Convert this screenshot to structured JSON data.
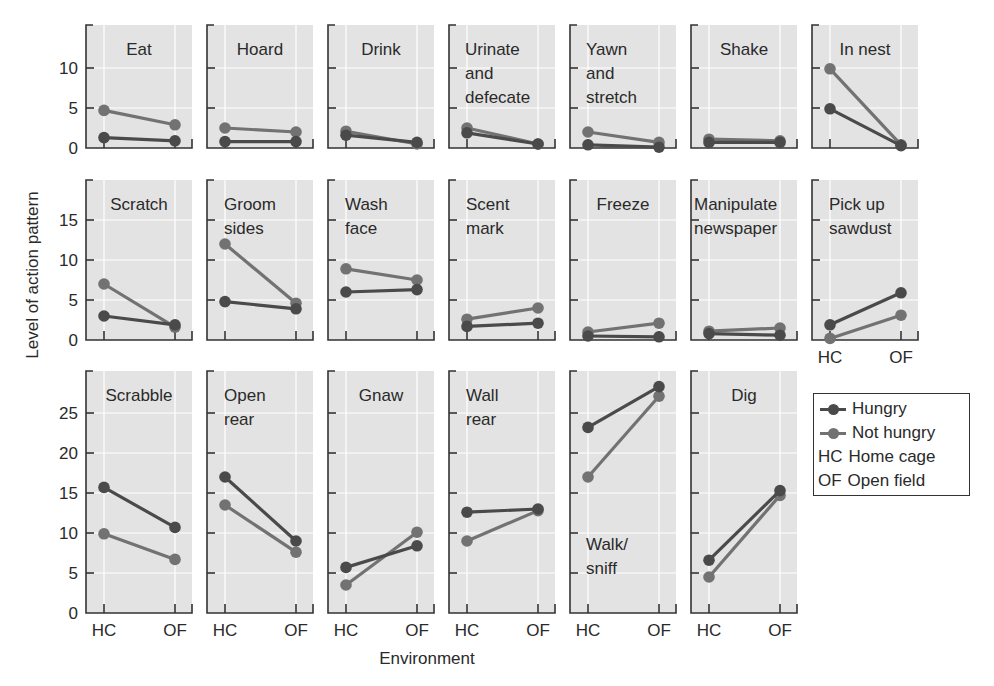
{
  "chart_data": {
    "type": "line",
    "title": "",
    "xlabel": "Environment",
    "ylabel": "Level of action pattern",
    "categories": [
      "HC",
      "OF"
    ],
    "legend": [
      {
        "key": "line",
        "label": "Hungry",
        "color": "#4a4a4a"
      },
      {
        "key": "line",
        "label": "Not hungry",
        "color": "#6f6f6f"
      },
      {
        "key": "HC",
        "label": "Home cage"
      },
      {
        "key": "OF",
        "label": "Open field"
      }
    ],
    "legend_position": "right, lower row",
    "grid": true,
    "rows": [
      {
        "ylim": [
          0,
          15
        ],
        "yticks": [
          0,
          5,
          10
        ],
        "panels": [
          {
            "title": "Eat",
            "series": [
              {
                "name": "Hungry",
                "values": [
                  1.3,
                  0.9
                ]
              },
              {
                "name": "Not hungry",
                "values": [
                  4.7,
                  2.9
                ]
              }
            ]
          },
          {
            "title": "Hoard",
            "series": [
              {
                "name": "Hungry",
                "values": [
                  0.8,
                  0.8
                ]
              },
              {
                "name": "Not hungry",
                "values": [
                  2.5,
                  2.0
                ]
              }
            ]
          },
          {
            "title": "Drink",
            "series": [
              {
                "name": "Hungry",
                "values": [
                  1.6,
                  0.7
                ]
              },
              {
                "name": "Not hungry",
                "values": [
                  2.1,
                  0.5
                ]
              }
            ]
          },
          {
            "title": "Urinate and defecate",
            "series": [
              {
                "name": "Hungry",
                "values": [
                  1.9,
                  0.5
                ]
              },
              {
                "name": "Not hungry",
                "values": [
                  2.5,
                  0.5
                ]
              }
            ]
          },
          {
            "title": "Yawn and stretch",
            "series": [
              {
                "name": "Hungry",
                "values": [
                  0.4,
                  0.1
                ]
              },
              {
                "name": "Not hungry",
                "values": [
                  2.0,
                  0.7
                ]
              }
            ]
          },
          {
            "title": "Shake",
            "series": [
              {
                "name": "Hungry",
                "values": [
                  0.7,
                  0.7
                ]
              },
              {
                "name": "Not hungry",
                "values": [
                  1.1,
                  0.9
                ]
              }
            ]
          },
          {
            "title": "In nest",
            "series": [
              {
                "name": "Hungry",
                "values": [
                  4.9,
                  0.3
                ]
              },
              {
                "name": "Not hungry",
                "values": [
                  9.9,
                  0.4
                ]
              }
            ]
          }
        ]
      },
      {
        "ylim": [
          0,
          19
        ],
        "yticks": [
          0,
          5,
          10,
          15
        ],
        "panels": [
          {
            "title": "Scratch",
            "series": [
              {
                "name": "Hungry",
                "values": [
                  3.0,
                  1.9
                ]
              },
              {
                "name": "Not hungry",
                "values": [
                  7.0,
                  1.6
                ]
              }
            ]
          },
          {
            "title": "Groom sides",
            "series": [
              {
                "name": "Hungry",
                "values": [
                  4.8,
                  3.9
                ]
              },
              {
                "name": "Not hungry",
                "values": [
                  12.0,
                  4.6
                ]
              }
            ]
          },
          {
            "title": "Wash face",
            "series": [
              {
                "name": "Hungry",
                "values": [
                  6.0,
                  6.3
                ]
              },
              {
                "name": "Not hungry",
                "values": [
                  8.9,
                  7.5
                ]
              }
            ]
          },
          {
            "title": "Scent mark",
            "series": [
              {
                "name": "Hungry",
                "values": [
                  1.7,
                  2.1
                ]
              },
              {
                "name": "Not hungry",
                "values": [
                  2.6,
                  4.0
                ]
              }
            ]
          },
          {
            "title": "Freeze",
            "series": [
              {
                "name": "Hungry",
                "values": [
                  0.5,
                  0.4
                ]
              },
              {
                "name": "Not hungry",
                "values": [
                  1.0,
                  2.1
                ]
              }
            ]
          },
          {
            "title": "Manipulate newspaper",
            "series": [
              {
                "name": "Hungry",
                "values": [
                  0.8,
                  0.6
                ]
              },
              {
                "name": "Not hungry",
                "values": [
                  1.1,
                  1.5
                ]
              }
            ]
          },
          {
            "title": "Pick up sawdust",
            "series": [
              {
                "name": "Hungry",
                "values": [
                  1.9,
                  5.9
                ]
              },
              {
                "name": "Not hungry",
                "values": [
                  0.2,
                  3.1
                ]
              }
            ],
            "show_x_ticks": true
          }
        ]
      },
      {
        "ylim": [
          0,
          29
        ],
        "yticks": [
          0,
          5,
          10,
          15,
          20,
          25
        ],
        "panels": [
          {
            "title": "Scrabble",
            "series": [
              {
                "name": "Hungry",
                "values": [
                  15.7,
                  10.7
                ]
              },
              {
                "name": "Not hungry",
                "values": [
                  9.9,
                  6.7
                ]
              }
            ]
          },
          {
            "title": "Open rear",
            "series": [
              {
                "name": "Hungry",
                "values": [
                  17.0,
                  9.0
                ]
              },
              {
                "name": "Not hungry",
                "values": [
                  13.5,
                  7.6
                ]
              }
            ]
          },
          {
            "title": "Gnaw",
            "series": [
              {
                "name": "Hungry",
                "values": [
                  5.7,
                  8.4
                ]
              },
              {
                "name": "Not hungry",
                "values": [
                  3.5,
                  10.1
                ]
              }
            ]
          },
          {
            "title": "Wall rear",
            "series": [
              {
                "name": "Hungry",
                "values": [
                  12.6,
                  13.0
                ]
              },
              {
                "name": "Not hungry",
                "values": [
                  9.0,
                  12.8
                ]
              }
            ]
          },
          {
            "title": "Walk/sniff",
            "series": [
              {
                "name": "Hungry",
                "values": [
                  23.2,
                  28.3
                ]
              },
              {
                "name": "Not hungry",
                "values": [
                  17.0,
                  27.1
                ]
              }
            ],
            "title_position": "bottom"
          },
          {
            "title": "Dig",
            "series": [
              {
                "name": "Hungry",
                "values": [
                  6.6,
                  15.3
                ]
              },
              {
                "name": "Not hungry",
                "values": [
                  4.5,
                  14.7
                ]
              }
            ]
          }
        ]
      }
    ]
  },
  "labels": {
    "ylabel": "Level of action pattern",
    "xlabel": "Environment",
    "legend": {
      "hungry": "Hungry",
      "not_hungry": "Not hungry",
      "hc_code": "HC",
      "hc_label": "Home cage",
      "of_code": "OF",
      "of_label": "Open field"
    }
  },
  "colors": {
    "hungry": "#4a4a4a",
    "not_hungry": "#727272",
    "panel_bg": "#e3e3e3",
    "grid": "#ffffff",
    "axis": "#333333",
    "text": "#2a2a2a"
  }
}
